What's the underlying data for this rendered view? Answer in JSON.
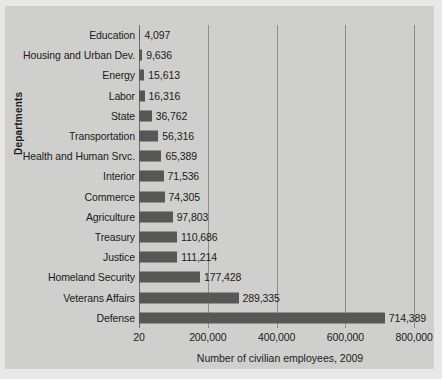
{
  "chart_data": {
    "type": "bar",
    "orientation": "horizontal",
    "title": "",
    "xlabel": "Number of civilian employees, 2009",
    "ylabel": "Departments",
    "grid": true,
    "legend": false,
    "xlim": [
      0,
      820000
    ],
    "x_ticks": [
      "20",
      "200,000",
      "400,000",
      "600,000",
      "800,000"
    ],
    "x_tick_values": [
      0,
      200000,
      400000,
      600000,
      800000
    ],
    "categories": [
      "Education",
      "Housing and Urban Dev.",
      "Energy",
      "Labor",
      "State",
      "Transportation",
      "Health and Human Srvc.",
      "Interior",
      "Commerce",
      "Agriculture",
      "Treasury",
      "Justice",
      "Homeland Security",
      "Veterans Affairs",
      "Defense"
    ],
    "values": [
      4097,
      9636,
      15613,
      16316,
      36762,
      56316,
      65389,
      71536,
      74305,
      97803,
      110686,
      111214,
      177428,
      289335,
      714389
    ],
    "value_labels": [
      "4,097",
      "9,636",
      "15,613",
      "16,316",
      "36,762",
      "56,316",
      "65,389",
      "71,536",
      "74,305",
      "97,803",
      "110,686",
      "111,214",
      "177,428",
      "289,335",
      "714,389"
    ],
    "bar_color": "#575756",
    "grid_color": "#8d8d8b",
    "background_color": "#cfcfcd",
    "text_color": "#1b1b1b"
  }
}
